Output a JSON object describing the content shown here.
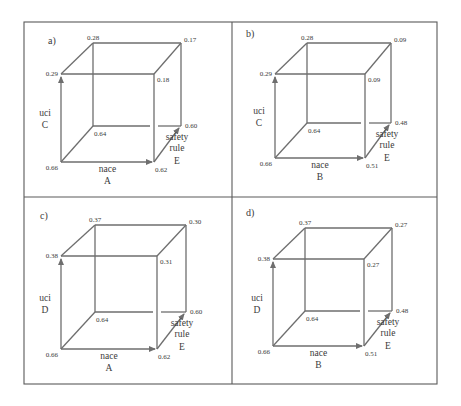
{
  "figure": {
    "frame": {
      "x": 24,
      "y": 22,
      "w": 413,
      "h": 362,
      "divider_x": 232,
      "divider_y": 197
    },
    "colors": {
      "line": "#6e6e6e",
      "frame": "#5a5a5a",
      "text": "#3a3a3a",
      "background": "#ffffff"
    },
    "panels": [
      {
        "id": "a",
        "label": "a)",
        "label_pos": [
          48,
          44
        ],
        "cube": {
          "fl": 61,
          "fr": 154,
          "ft": 74,
          "fb": 162,
          "bl": 93,
          "br": 181,
          "bt": 43,
          "bb": 126
        },
        "vertices": {
          "back_top_left": "0.28",
          "back_top_right": "0.17",
          "front_top_left": "0.29",
          "front_top_right": "0.18",
          "back_bottom_left": "0.64",
          "back_bottom_right": "0.60",
          "front_bottom_left": "0.66",
          "front_bottom_right": "0.62"
        },
        "axes": {
          "vertical": {
            "name": "uci",
            "letter": "C"
          },
          "horizontal": {
            "name": "nace",
            "letter": "A"
          },
          "depth": {
            "name1": "safety",
            "name2": "rule",
            "letter": "E"
          }
        }
      },
      {
        "id": "b",
        "label": "b)",
        "label_pos": [
          246,
          37
        ],
        "cube": {
          "fl": 275,
          "fr": 365,
          "ft": 74,
          "fb": 158,
          "bl": 307,
          "br": 391,
          "bt": 43,
          "bb": 123
        },
        "vertices": {
          "back_top_left": "0.28",
          "back_top_right": "0.09",
          "front_top_left": "0.29",
          "front_top_right": "0.09",
          "back_bottom_left": "0.64",
          "back_bottom_right": "0.48",
          "front_bottom_left": "0.66",
          "front_bottom_right": "0.51"
        },
        "axes": {
          "vertical": {
            "name": "uci",
            "letter": "C"
          },
          "horizontal": {
            "name": "nace",
            "letter": "B"
          },
          "depth": {
            "name1": "safety",
            "name2": "rule",
            "letter": "E"
          }
        }
      },
      {
        "id": "c",
        "label": "c)",
        "label_pos": [
          40,
          219
        ],
        "cube": {
          "fl": 61,
          "fr": 157,
          "ft": 256,
          "fb": 349,
          "bl": 95,
          "br": 186,
          "bt": 225,
          "bb": 312
        },
        "vertices": {
          "back_top_left": "0.37",
          "back_top_right": "0.30",
          "front_top_left": "0.38",
          "front_top_right": "0.31",
          "back_bottom_left": "0.64",
          "back_bottom_right": "0.60",
          "front_bottom_left": "0.66",
          "front_bottom_right": "0.62"
        },
        "axes": {
          "vertical": {
            "name": "uci",
            "letter": "D"
          },
          "horizontal": {
            "name": "nace",
            "letter": "A"
          },
          "depth": {
            "name1": "safety",
            "name2": "rule",
            "letter": "E"
          }
        }
      },
      {
        "id": "d",
        "label": "d)",
        "label_pos": [
          246,
          216
        ],
        "cube": {
          "fl": 273,
          "fr": 364,
          "ft": 259,
          "fb": 346,
          "bl": 305,
          "br": 392,
          "bt": 228,
          "bb": 311
        },
        "vertices": {
          "back_top_left": "0.37",
          "back_top_right": "0.27",
          "front_top_left": "0.38",
          "front_top_right": "0.27",
          "back_bottom_left": "0.64",
          "back_bottom_right": "0.48",
          "front_bottom_left": "0.66",
          "front_bottom_right": "0.51"
        },
        "axes": {
          "vertical": {
            "name": "uci",
            "letter": "D"
          },
          "horizontal": {
            "name": "nace",
            "letter": "B"
          },
          "depth": {
            "name1": "safety",
            "name2": "rule",
            "letter": "E"
          }
        }
      }
    ]
  }
}
